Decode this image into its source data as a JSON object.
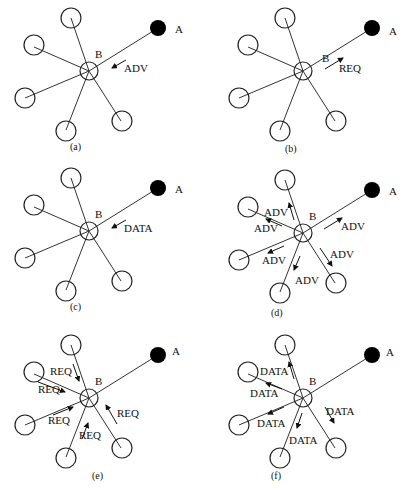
{
  "figure": {
    "panels": [
      {
        "id": "a",
        "caption": "(a)",
        "source_label": "A",
        "hub_label": "B",
        "messages": [
          {
            "text": "ADV",
            "direction": "A-to-B"
          }
        ]
      },
      {
        "id": "b",
        "caption": "(b)",
        "source_label": "A",
        "hub_label": "B",
        "messages": [
          {
            "text": "REQ",
            "direction": "B-to-A"
          }
        ]
      },
      {
        "id": "c",
        "caption": "(c)",
        "source_label": "A",
        "hub_label": "B",
        "messages": [
          {
            "text": "DATA",
            "direction": "A-to-B"
          }
        ]
      },
      {
        "id": "d",
        "caption": "(d)",
        "source_label": "A",
        "hub_label": "B",
        "messages": [
          {
            "text": "ADV",
            "direction": "B-to-A"
          },
          {
            "text": "ADV",
            "direction": "B-to-top"
          },
          {
            "text": "ADV",
            "direction": "B-to-upper-left"
          },
          {
            "text": "ADV",
            "direction": "B-to-left"
          },
          {
            "text": "ADV",
            "direction": "B-to-bottom"
          },
          {
            "text": "ADV",
            "direction": "B-to-lower-right"
          }
        ]
      },
      {
        "id": "e",
        "caption": "(e)",
        "source_label": "A",
        "hub_label": "B",
        "messages": [
          {
            "text": "REQ",
            "direction": "top-to-B"
          },
          {
            "text": "REQ",
            "direction": "upper-left-to-B"
          },
          {
            "text": "REQ",
            "direction": "left-to-B"
          },
          {
            "text": "REQ",
            "direction": "bottom-to-B"
          },
          {
            "text": "REQ",
            "direction": "lower-right-to-B"
          }
        ]
      },
      {
        "id": "f",
        "caption": "(f)",
        "source_label": "A",
        "hub_label": "B",
        "messages": [
          {
            "text": "DATA",
            "direction": "B-to-top"
          },
          {
            "text": "DATA",
            "direction": "B-to-upper-left"
          },
          {
            "text": "DATA",
            "direction": "B-to-left"
          },
          {
            "text": "DATA",
            "direction": "B-to-bottom"
          },
          {
            "text": "DATA",
            "direction": "B-to-lower-right"
          }
        ]
      }
    ]
  }
}
